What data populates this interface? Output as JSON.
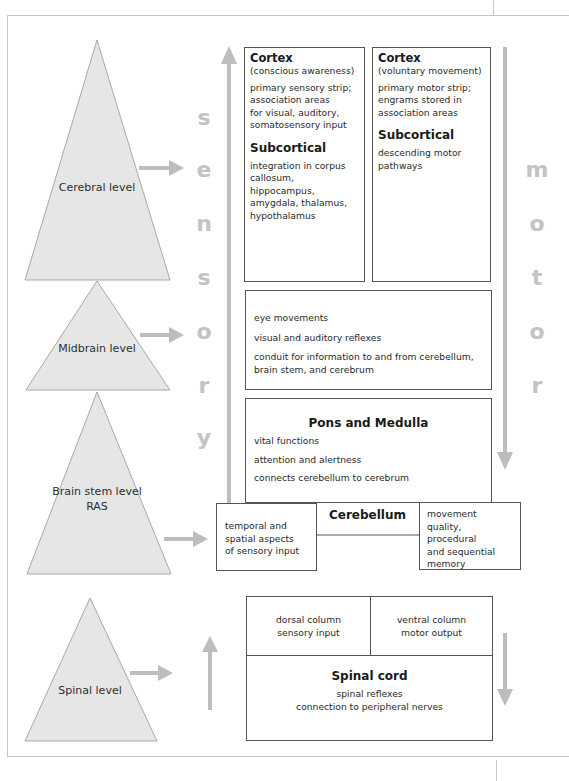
{
  "diagram": {
    "levels": [
      {
        "id": "cerebral",
        "label_lines": [
          "Cerebral",
          "level"
        ]
      },
      {
        "id": "midbrain",
        "label_lines": [
          "Midbrain",
          "level"
        ]
      },
      {
        "id": "brainstem",
        "label_lines": [
          "Brain",
          "stem level",
          "RAS"
        ]
      },
      {
        "id": "spinal",
        "label_lines": [
          "Spinal",
          "level"
        ]
      }
    ],
    "sensory_word": [
      "s",
      "e",
      "n",
      "s",
      "o",
      "r",
      "y"
    ],
    "motor_word": [
      "m",
      "o",
      "t",
      "o",
      "r"
    ],
    "cortex_sensory": {
      "title": "Cortex",
      "subtitle": "(conscious awareness)",
      "text_lines": [
        "primary sensory strip;",
        "association areas",
        "for visual, auditory,",
        "somatosensory input"
      ],
      "sub_title": "Subcortical",
      "sub_lines": [
        "integration in corpus",
        "callosum, hippocampus,",
        "amygdala, thalamus,",
        "hypothalamus"
      ]
    },
    "cortex_motor": {
      "title": "Cortex",
      "subtitle": "(voluntary movement)",
      "text_lines": [
        "primary motor strip;",
        "engrams stored in",
        "association areas"
      ],
      "sub_title": "Subcortical",
      "sub_lines": [
        "descending motor",
        "pathways"
      ]
    },
    "midbrain_box": {
      "items": [
        "eye movements",
        "visual and auditory reflexes",
        "conduit for information to and from cerebellum,",
        "brain stem, and cerebrum"
      ]
    },
    "pons_box": {
      "title": "Pons and Medulla",
      "items": [
        "vital functions",
        "attention and alertness",
        "connects cerebellum to cerebrum"
      ]
    },
    "cerebellum": {
      "title": "Cerebellum",
      "left_lines": [
        "temporal and",
        "spatial aspects",
        "of sensory input"
      ],
      "right_lines": [
        "movement quality,",
        "procedural",
        "and sequential",
        "memory"
      ]
    },
    "spinal_box": {
      "dorsal_lines": [
        "dorsal column",
        "sensory input"
      ],
      "ventral_lines": [
        "ventral column",
        "motor output"
      ],
      "title": "Spinal cord",
      "items": [
        "spinal reflexes",
        "connection to peripheral nerves"
      ]
    },
    "colors": {
      "triangle_fill": "#e6e6e6",
      "triangle_stroke": "#a8a8a8",
      "arrow": "#bdbdbd",
      "letters": "#c3c3c3",
      "box_border": "#555555"
    }
  }
}
